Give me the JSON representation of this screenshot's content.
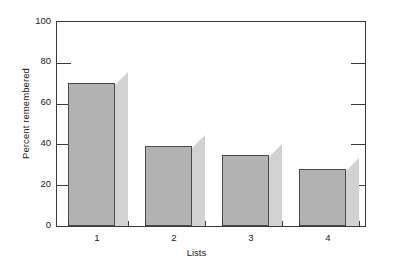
{
  "chart_data": {
    "type": "bar",
    "title": "",
    "subtitle": "",
    "xlabel": "Lists",
    "ylabel": "Percent remembered",
    "categories": [
      "1",
      "2",
      "3",
      "4"
    ],
    "values": [
      70,
      39,
      35,
      28
    ],
    "series": [
      {
        "name": "Percent remembered",
        "values": [
          70,
          39,
          35,
          28
        ]
      }
    ],
    "ylim": [
      0,
      100
    ],
    "yticks": [
      0,
      20,
      40,
      60,
      80,
      100
    ],
    "ytick_labels": [
      "0",
      "20",
      "40",
      "60",
      "80",
      "100"
    ],
    "xtick_labels": [
      "1",
      "2",
      "3",
      "4"
    ],
    "grid": false,
    "legend": "none",
    "annotations": [],
    "style": {
      "bar_face_color": "#b2b2b2",
      "bar_side_color": "#d2d2d2",
      "bar_top_color": "#c8c8c8",
      "bar_edge_color": "#4a4a4a",
      "axis_color": "#3a3a3a",
      "text_color": "#1a1a1a",
      "background_color": "#ffffff"
    }
  }
}
